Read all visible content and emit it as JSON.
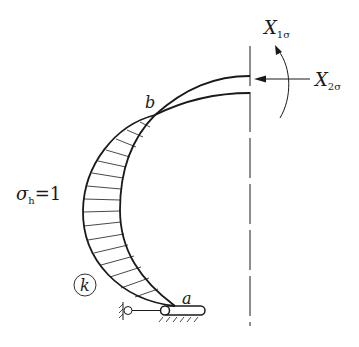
{
  "diagram": {
    "labels": {
      "point_a": "a",
      "point_b": "b",
      "moment": {
        "main": "X",
        "sub": "1σ"
      },
      "force": {
        "main": "X",
        "sub": "2σ"
      },
      "stress": {
        "main": "σ",
        "sub": "h",
        "eq": "=1"
      },
      "region": "k"
    },
    "colors": {
      "stroke": "#1a1a1a",
      "background": "#ffffff"
    }
  }
}
